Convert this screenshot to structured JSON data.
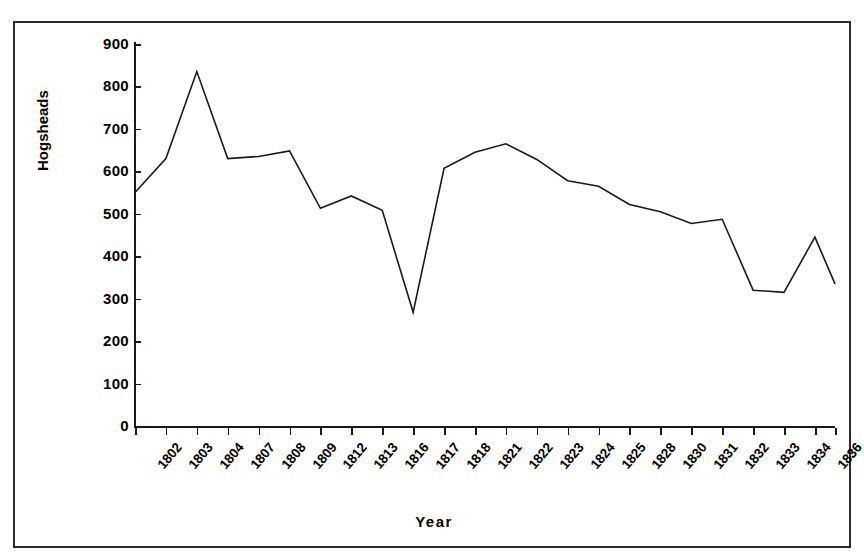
{
  "chart_data": {
    "type": "line",
    "title": "",
    "xlabel": "Year",
    "ylabel": "Hogsheads",
    "grid": false,
    "legend": "none",
    "ylim": [
      0,
      900
    ],
    "yticks": [
      900,
      800,
      700,
      600,
      500,
      400,
      300,
      200,
      100,
      0
    ],
    "categories": [
      "1802",
      "1803",
      "1804",
      "1807",
      "1808",
      "1809",
      "1812",
      "1813",
      "1816",
      "1817",
      "1818",
      "1821",
      "1822",
      "1823",
      "1824",
      "1825",
      "1828",
      "1830",
      "1831",
      "1832",
      "1833",
      "1834",
      "1836"
    ],
    "values": [
      550,
      630,
      835,
      630,
      635,
      648,
      513,
      542,
      508,
      268,
      607,
      645,
      665,
      628,
      578,
      565,
      522,
      505,
      477,
      487,
      320,
      315,
      445
    ],
    "series": [
      {
        "name": "Hogsheads",
        "values": [
          550,
          630,
          835,
          630,
          635,
          648,
          513,
          542,
          508,
          268,
          607,
          645,
          665,
          628,
          578,
          565,
          522,
          505,
          477,
          487,
          320,
          315,
          445
        ],
        "color": "#1a1a1a"
      }
    ],
    "trailing_value": 335,
    "line_color": "#1a1a1a",
    "line_width": 1.6,
    "border_color": "#2b2b2b",
    "background_color": "#ffffff"
  }
}
